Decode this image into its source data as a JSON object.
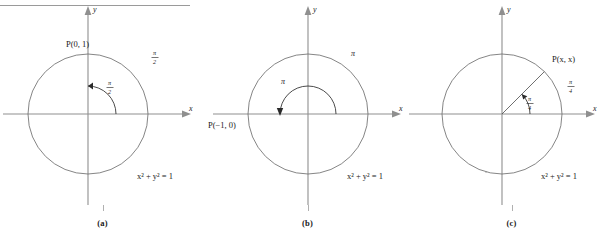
{
  "figure": {
    "equation": "x² + y² = 1",
    "axis_x_label": "x",
    "axis_y_label": "y",
    "rule_color": "#9a9a9a",
    "circle_color": "#6f6f6f",
    "axis_color": "#8f8f8f",
    "arc_color": "#2a2a2a"
  },
  "panels": [
    {
      "id": "a",
      "caption": "(a)",
      "point_label": "P(0, 1)",
      "angle_numerator": "π",
      "angle_denominator": "2",
      "angle_text": "π/2",
      "angle_degrees": 90,
      "arc_label_inner": "π/2",
      "arc_label_outer": "π/2",
      "equation": "x² + y² = 1",
      "axis_x_label": "x",
      "axis_y_label": "y",
      "has_radius_line": false,
      "point_x": 0,
      "point_y": 1
    },
    {
      "id": "b",
      "caption": "(b)",
      "point_label": "P(−1, 0)",
      "angle_numerator": "π",
      "angle_denominator": "",
      "angle_text": "π",
      "angle_degrees": 180,
      "arc_label_inner": "π",
      "arc_label_outer": "π",
      "equation": "x² + y² = 1",
      "axis_x_label": "x",
      "axis_y_label": "y",
      "has_radius_line": false,
      "point_x": -1,
      "point_y": 0
    },
    {
      "id": "c",
      "caption": "(c)",
      "point_label": "P(x, x)",
      "angle_numerator": "π",
      "angle_denominator": "4",
      "angle_text": "π/4",
      "angle_degrees": 45,
      "arc_label_inner": "π/4",
      "arc_label_outer": "π/4",
      "equation": "x² + y² = 1",
      "axis_x_label": "x",
      "axis_y_label": "y",
      "has_radius_line": true,
      "point_x": 0.7071,
      "point_y": 0.7071
    }
  ]
}
